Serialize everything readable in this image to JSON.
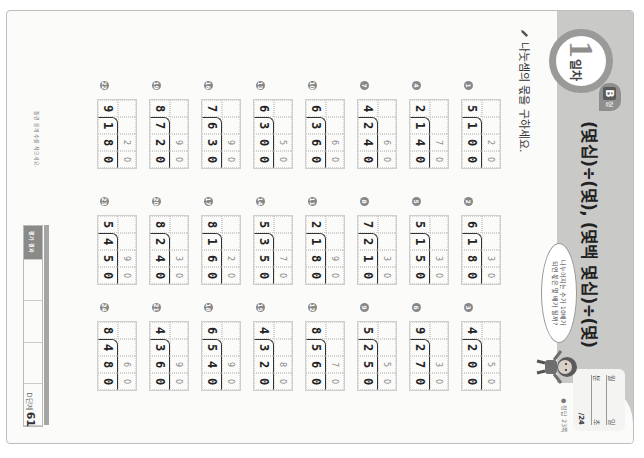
{
  "header": {
    "day_number": "1",
    "day_unit": "일차",
    "level_letter": "B",
    "level_unit": "형",
    "title": "(몇십)÷(몇), (몇백 몇십)÷(몇)",
    "score_box": {
      "date_labels": [
        "월",
        "일"
      ],
      "time_labels": [
        "분",
        "초"
      ],
      "score_total": "/24"
    },
    "answer_ref": "● 정답 23쪽",
    "speech_bubble": [
      "나누어지는 수가 10배가",
      "되면 몫은 몇 배가 될까?"
    ]
  },
  "instruction": "나눗셈의 몫을 구하세요.",
  "problems": [
    {
      "num": "1",
      "divisor": "5",
      "dividend": "100",
      "quotient": "20"
    },
    {
      "num": "2",
      "divisor": "6",
      "dividend": "180",
      "quotient": "30"
    },
    {
      "num": "3",
      "divisor": "4",
      "dividend": "200",
      "quotient": "50"
    },
    {
      "num": "4",
      "divisor": "2",
      "dividend": "140",
      "quotient": "70"
    },
    {
      "num": "5",
      "divisor": "5",
      "dividend": "150",
      "quotient": "30"
    },
    {
      "num": "6",
      "divisor": "9",
      "dividend": "270",
      "quotient": "30"
    },
    {
      "num": "7",
      "divisor": "4",
      "dividend": "240",
      "quotient": "60"
    },
    {
      "num": "8",
      "divisor": "7",
      "dividend": "210",
      "quotient": "30"
    },
    {
      "num": "9",
      "divisor": "5",
      "dividend": "250",
      "quotient": "50"
    },
    {
      "num": "10",
      "divisor": "6",
      "dividend": "360",
      "quotient": "60"
    },
    {
      "num": "11",
      "divisor": "2",
      "dividend": "180",
      "quotient": "90"
    },
    {
      "num": "12",
      "divisor": "8",
      "dividend": "560",
      "quotient": "70"
    },
    {
      "num": "13",
      "divisor": "6",
      "dividend": "300",
      "quotient": "50"
    },
    {
      "num": "14",
      "divisor": "5",
      "dividend": "350",
      "quotient": "70"
    },
    {
      "num": "15",
      "divisor": "4",
      "dividend": "320",
      "quotient": "80"
    },
    {
      "num": "16",
      "divisor": "7",
      "dividend": "630",
      "quotient": "90"
    },
    {
      "num": "17",
      "divisor": "8",
      "dividend": "160",
      "quotient": "20"
    },
    {
      "num": "18",
      "divisor": "6",
      "dividend": "540",
      "quotient": "90"
    },
    {
      "num": "19",
      "divisor": "8",
      "dividend": "720",
      "quotient": "90"
    },
    {
      "num": "20",
      "divisor": "8",
      "dividend": "240",
      "quotient": "30"
    },
    {
      "num": "21",
      "divisor": "4",
      "dividend": "360",
      "quotient": "90"
    },
    {
      "num": "22",
      "divisor": "9",
      "dividend": "180",
      "quotient": "20"
    },
    {
      "num": "23",
      "divisor": "5",
      "dividend": "450",
      "quotient": "90"
    },
    {
      "num": "24",
      "divisor": "8",
      "dividend": "480",
      "quotient": "60"
    }
  ],
  "footer": {
    "note": "틀린 문제 수를 적으세요.",
    "table_head": "평가 결과",
    "table_cells": [
      "",
      "",
      "",
      ""
    ],
    "page_label": "D단계",
    "page_number": "61"
  }
}
